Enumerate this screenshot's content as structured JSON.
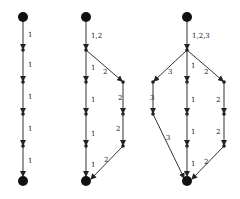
{
  "diagrams": [
    {
      "name": "single-path",
      "labels": {
        "e1": "1",
        "e2": "1",
        "e3": "1",
        "e4": "1",
        "e5": "1"
      }
    },
    {
      "name": "two-paths",
      "labels": {
        "top": "1,2",
        "a1": "1",
        "a2": "1",
        "a3": "1",
        "a4": "1",
        "b1": "2",
        "b2": "2",
        "b3": "2",
        "b4": "2"
      }
    },
    {
      "name": "three-paths",
      "labels": {
        "top": "1,2,3",
        "c1": "3",
        "c2": "3",
        "c3": "3",
        "a1": "1",
        "a2": "1",
        "a3": "1",
        "a4": "1",
        "b1": "2",
        "b2": "2",
        "b3": "2",
        "b4": "2"
      }
    }
  ]
}
